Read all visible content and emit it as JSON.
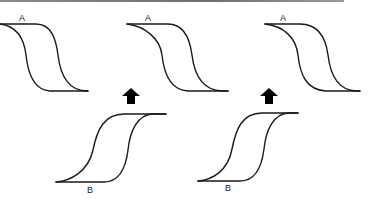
{
  "figure": {
    "colors": {
      "line": "#1a1a1a",
      "arrow": "#000000",
      "top_rule": "#7a7a7a",
      "background": "#ffffff"
    },
    "top_row": {
      "loops": [
        {
          "label": "A",
          "orientation": "descending"
        },
        {
          "label": "A",
          "orientation": "descending"
        },
        {
          "label": "A",
          "orientation": "descending"
        }
      ]
    },
    "arrows": [
      {
        "icon": "up-arrow-icon",
        "direction": "up"
      },
      {
        "icon": "up-arrow-icon",
        "direction": "up"
      }
    ],
    "bottom_row": {
      "loops": [
        {
          "label": "B",
          "orientation": "ascending"
        },
        {
          "label": "B",
          "orientation": "ascending"
        }
      ]
    }
  }
}
